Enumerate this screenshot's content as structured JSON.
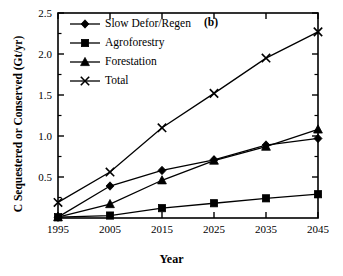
{
  "chart_data": {
    "type": "line",
    "title": "",
    "panel_label": "(b)",
    "xlabel": "Year",
    "ylabel": "C Sequestered or Conserved (Gt/yr)",
    "x": [
      1995,
      2005,
      2015,
      2025,
      2035,
      2045
    ],
    "xtick_labels": [
      "1995",
      "2005",
      "2015",
      "2025",
      "2035",
      "2045"
    ],
    "ytick_labels": [
      "0.5",
      "1.0",
      "1.5",
      "2.0",
      "2.5"
    ],
    "ytick_values": [
      0.5,
      1.0,
      1.5,
      2.0,
      2.5
    ],
    "xlim": [
      1995,
      2045
    ],
    "ylim": [
      0,
      2.5
    ],
    "grid": false,
    "legend_position": "upper-left-inside",
    "series": [
      {
        "name": "Slow Defor/Regen",
        "marker": "diamond",
        "values": [
          0.01,
          0.39,
          0.58,
          0.71,
          0.89,
          0.97
        ]
      },
      {
        "name": "Agroforestry",
        "marker": "square",
        "values": [
          0.01,
          0.03,
          0.12,
          0.18,
          0.24,
          0.29
        ]
      },
      {
        "name": "Forestation",
        "marker": "triangle",
        "values": [
          0.01,
          0.17,
          0.46,
          0.7,
          0.87,
          1.08
        ]
      },
      {
        "name": "Total",
        "marker": "cross",
        "values": [
          0.19,
          0.56,
          1.1,
          1.52,
          1.95,
          2.27
        ]
      }
    ],
    "colors": {
      "line": "#000000",
      "axis": "#000000",
      "background": "#ffffff"
    }
  }
}
